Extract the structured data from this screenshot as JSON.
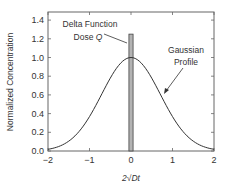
{
  "chart_data": {
    "type": "line",
    "title": "",
    "xlabel": "2√Dt",
    "ylabel": "Normalized Concentration",
    "xlim": [
      -2,
      2
    ],
    "ylim": [
      0,
      1.45
    ],
    "xticks": [
      -2,
      -1,
      0,
      1,
      2
    ],
    "xtick_labels": [
      "−2",
      "−1",
      "0",
      "1",
      "2"
    ],
    "yticks": [
      0,
      0.2,
      0.4,
      0.6,
      0.8,
      1.0,
      1.2,
      1.4
    ],
    "ytick_labels": [
      "0.0",
      "0.2",
      "0.4",
      "0.6",
      "0.8",
      "1.0",
      "1.2",
      "1.4"
    ],
    "grid": false,
    "legend": null,
    "series": [
      {
        "name": "Gaussian Profile",
        "kind": "line",
        "color": "#333333",
        "x": [
          -2,
          -1.75,
          -1.5,
          -1.25,
          -1,
          -0.75,
          -0.5,
          -0.25,
          0,
          0.25,
          0.5,
          0.75,
          1,
          1.25,
          1.5,
          1.75,
          2
        ],
        "y": [
          0.018,
          0.047,
          0.105,
          0.21,
          0.37,
          0.57,
          0.78,
          0.94,
          1.0,
          0.94,
          0.78,
          0.57,
          0.37,
          0.21,
          0.105,
          0.047,
          0.018
        ]
      },
      {
        "name": "Delta Function Dose Q",
        "kind": "bar",
        "color": "#b3b3b3",
        "x_center": 0,
        "width": 0.1,
        "height": 1.25
      }
    ],
    "annotations": [
      {
        "text_line1": "Delta Function",
        "text_line2_prefix": "Dose ",
        "text_line2_var": "Q",
        "points_to": "delta bar"
      },
      {
        "text_line1": "Gaussian",
        "text_line2": "Profile",
        "points_to": "gaussian curve"
      }
    ]
  }
}
